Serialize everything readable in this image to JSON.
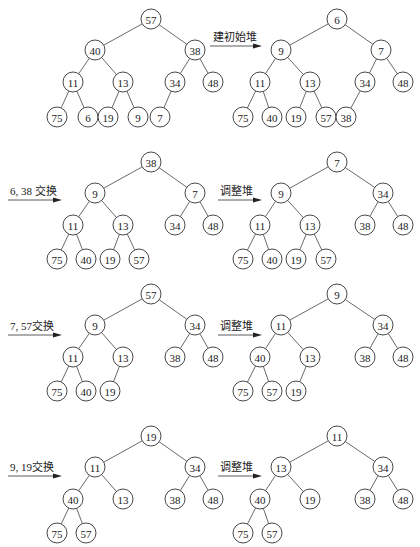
{
  "figure": {
    "node_radius": 10
  },
  "panels": [
    {
      "id": "initial-tree",
      "caption": "",
      "nodes": [
        {
          "v": "57",
          "x": 151,
          "y": 19
        },
        {
          "v": "40",
          "x": 95,
          "y": 50
        },
        {
          "v": "38",
          "x": 195,
          "y": 50
        },
        {
          "v": "11",
          "x": 73,
          "y": 82
        },
        {
          "v": "13",
          "x": 123,
          "y": 82
        },
        {
          "v": "34",
          "x": 175,
          "y": 82
        },
        {
          "v": "48",
          "x": 213,
          "y": 82
        },
        {
          "v": "75",
          "x": 57,
          "y": 117
        },
        {
          "v": "6",
          "x": 88,
          "y": 117
        },
        {
          "v": "19",
          "x": 108,
          "y": 117
        },
        {
          "v": "9",
          "x": 138,
          "y": 117
        },
        {
          "v": "7",
          "x": 160,
          "y": 117
        }
      ],
      "edges": [
        [
          0,
          1
        ],
        [
          0,
          2
        ],
        [
          1,
          3
        ],
        [
          1,
          4
        ],
        [
          2,
          5
        ],
        [
          2,
          6
        ],
        [
          3,
          7
        ],
        [
          3,
          8
        ],
        [
          4,
          9
        ],
        [
          4,
          10
        ],
        [
          5,
          11
        ]
      ]
    },
    {
      "id": "build-heap",
      "caption": "建初始堆",
      "arrow": {
        "x1": 210,
        "y1": 46,
        "x2": 262,
        "y2": 46,
        "lx": 213,
        "ly": 41
      },
      "nodes": [
        {
          "v": "6",
          "x": 337,
          "y": 19
        },
        {
          "v": "9",
          "x": 281,
          "y": 50
        },
        {
          "v": "7",
          "x": 381,
          "y": 50
        },
        {
          "v": "11",
          "x": 260,
          "y": 82
        },
        {
          "v": "13",
          "x": 310,
          "y": 82
        },
        {
          "v": "34",
          "x": 365,
          "y": 82
        },
        {
          "v": "48",
          "x": 403,
          "y": 82
        },
        {
          "v": "75",
          "x": 243,
          "y": 117
        },
        {
          "v": "40",
          "x": 272,
          "y": 117
        },
        {
          "v": "19",
          "x": 296,
          "y": 117
        },
        {
          "v": "57",
          "x": 326,
          "y": 117
        },
        {
          "v": "38",
          "x": 346,
          "y": 117
        }
      ],
      "edges": [
        [
          0,
          1
        ],
        [
          0,
          2
        ],
        [
          1,
          3
        ],
        [
          1,
          4
        ],
        [
          2,
          5
        ],
        [
          2,
          6
        ],
        [
          3,
          7
        ],
        [
          3,
          8
        ],
        [
          4,
          9
        ],
        [
          4,
          10
        ],
        [
          5,
          11
        ]
      ]
    },
    {
      "id": "swap-6-38",
      "caption": "6, 38 交换",
      "arrow": {
        "x1": 8,
        "y1": 200,
        "x2": 62,
        "y2": 200,
        "lx": 10,
        "ly": 195
      },
      "nodes": [
        {
          "v": "38",
          "x": 151,
          "y": 162
        },
        {
          "v": "9",
          "x": 95,
          "y": 193
        },
        {
          "v": "7",
          "x": 195,
          "y": 193
        },
        {
          "v": "11",
          "x": 73,
          "y": 225
        },
        {
          "v": "13",
          "x": 123,
          "y": 225
        },
        {
          "v": "34",
          "x": 175,
          "y": 225
        },
        {
          "v": "48",
          "x": 213,
          "y": 225
        },
        {
          "v": "75",
          "x": 57,
          "y": 259
        },
        {
          "v": "40",
          "x": 86,
          "y": 259
        },
        {
          "v": "19",
          "x": 110,
          "y": 259
        },
        {
          "v": "57",
          "x": 139,
          "y": 259
        }
      ],
      "edges": [
        [
          0,
          1
        ],
        [
          0,
          2
        ],
        [
          1,
          3
        ],
        [
          1,
          4
        ],
        [
          2,
          5
        ],
        [
          2,
          6
        ],
        [
          3,
          7
        ],
        [
          3,
          8
        ],
        [
          4,
          9
        ],
        [
          4,
          10
        ]
      ]
    },
    {
      "id": "adjust-1",
      "caption": "调整堆",
      "arrow": {
        "x1": 218,
        "y1": 200,
        "x2": 262,
        "y2": 200,
        "lx": 220,
        "ly": 195
      },
      "nodes": [
        {
          "v": "7",
          "x": 337,
          "y": 162
        },
        {
          "v": "9",
          "x": 281,
          "y": 193
        },
        {
          "v": "34",
          "x": 383,
          "y": 193
        },
        {
          "v": "11",
          "x": 260,
          "y": 225
        },
        {
          "v": "13",
          "x": 310,
          "y": 225
        },
        {
          "v": "38",
          "x": 365,
          "y": 225
        },
        {
          "v": "48",
          "x": 403,
          "y": 225
        },
        {
          "v": "75",
          "x": 243,
          "y": 259
        },
        {
          "v": "40",
          "x": 272,
          "y": 259
        },
        {
          "v": "19",
          "x": 296,
          "y": 259
        },
        {
          "v": "57",
          "x": 326,
          "y": 259
        }
      ],
      "edges": [
        [
          0,
          1
        ],
        [
          0,
          2
        ],
        [
          1,
          3
        ],
        [
          1,
          4
        ],
        [
          2,
          5
        ],
        [
          2,
          6
        ],
        [
          3,
          7
        ],
        [
          3,
          8
        ],
        [
          4,
          9
        ],
        [
          4,
          10
        ]
      ]
    },
    {
      "id": "swap-7-57",
      "caption": "7, 57交换",
      "arrow": {
        "x1": 8,
        "y1": 335,
        "x2": 62,
        "y2": 335,
        "lx": 10,
        "ly": 330
      },
      "nodes": [
        {
          "v": "57",
          "x": 151,
          "y": 294
        },
        {
          "v": "9",
          "x": 95,
          "y": 325
        },
        {
          "v": "34",
          "x": 195,
          "y": 325
        },
        {
          "v": "11",
          "x": 73,
          "y": 357
        },
        {
          "v": "13",
          "x": 123,
          "y": 357
        },
        {
          "v": "38",
          "x": 175,
          "y": 357
        },
        {
          "v": "48",
          "x": 213,
          "y": 357
        },
        {
          "v": "75",
          "x": 57,
          "y": 391
        },
        {
          "v": "40",
          "x": 86,
          "y": 391
        },
        {
          "v": "19",
          "x": 110,
          "y": 391
        }
      ],
      "edges": [
        [
          0,
          1
        ],
        [
          0,
          2
        ],
        [
          1,
          3
        ],
        [
          1,
          4
        ],
        [
          2,
          5
        ],
        [
          2,
          6
        ],
        [
          3,
          7
        ],
        [
          3,
          8
        ],
        [
          4,
          9
        ]
      ]
    },
    {
      "id": "adjust-2",
      "caption": "调整堆",
      "arrow": {
        "x1": 218,
        "y1": 335,
        "x2": 262,
        "y2": 335,
        "lx": 220,
        "ly": 330
      },
      "nodes": [
        {
          "v": "9",
          "x": 337,
          "y": 294
        },
        {
          "v": "11",
          "x": 281,
          "y": 325
        },
        {
          "v": "34",
          "x": 383,
          "y": 325
        },
        {
          "v": "40",
          "x": 260,
          "y": 357
        },
        {
          "v": "13",
          "x": 310,
          "y": 357
        },
        {
          "v": "38",
          "x": 365,
          "y": 357
        },
        {
          "v": "48",
          "x": 403,
          "y": 357
        },
        {
          "v": "75",
          "x": 243,
          "y": 391
        },
        {
          "v": "57",
          "x": 272,
          "y": 391
        },
        {
          "v": "19",
          "x": 296,
          "y": 391
        }
      ],
      "edges": [
        [
          0,
          1
        ],
        [
          0,
          2
        ],
        [
          1,
          3
        ],
        [
          1,
          4
        ],
        [
          2,
          5
        ],
        [
          2,
          6
        ],
        [
          3,
          7
        ],
        [
          3,
          8
        ],
        [
          4,
          9
        ]
      ]
    },
    {
      "id": "swap-9-19",
      "caption": "9, 19交换",
      "arrow": {
        "x1": 8,
        "y1": 476,
        "x2": 62,
        "y2": 476,
        "lx": 10,
        "ly": 471
      },
      "nodes": [
        {
          "v": "19",
          "x": 151,
          "y": 436
        },
        {
          "v": "11",
          "x": 95,
          "y": 467
        },
        {
          "v": "34",
          "x": 195,
          "y": 467
        },
        {
          "v": "40",
          "x": 73,
          "y": 499
        },
        {
          "v": "13",
          "x": 123,
          "y": 499
        },
        {
          "v": "38",
          "x": 175,
          "y": 499
        },
        {
          "v": "48",
          "x": 213,
          "y": 499
        },
        {
          "v": "75",
          "x": 57,
          "y": 533
        },
        {
          "v": "57",
          "x": 86,
          "y": 533
        }
      ],
      "edges": [
        [
          0,
          1
        ],
        [
          0,
          2
        ],
        [
          1,
          3
        ],
        [
          1,
          4
        ],
        [
          2,
          5
        ],
        [
          2,
          6
        ],
        [
          3,
          7
        ],
        [
          3,
          8
        ]
      ]
    },
    {
      "id": "adjust-3",
      "caption": "调整堆",
      "arrow": {
        "x1": 218,
        "y1": 476,
        "x2": 262,
        "y2": 476,
        "lx": 220,
        "ly": 471
      },
      "nodes": [
        {
          "v": "11",
          "x": 337,
          "y": 436
        },
        {
          "v": "13",
          "x": 281,
          "y": 467
        },
        {
          "v": "34",
          "x": 383,
          "y": 467
        },
        {
          "v": "40",
          "x": 260,
          "y": 499
        },
        {
          "v": "19",
          "x": 310,
          "y": 499
        },
        {
          "v": "38",
          "x": 365,
          "y": 499
        },
        {
          "v": "48",
          "x": 403,
          "y": 499
        },
        {
          "v": "75",
          "x": 243,
          "y": 533
        },
        {
          "v": "57",
          "x": 272,
          "y": 533
        }
      ],
      "edges": [
        [
          0,
          1
        ],
        [
          0,
          2
        ],
        [
          1,
          3
        ],
        [
          1,
          4
        ],
        [
          2,
          5
        ],
        [
          2,
          6
        ],
        [
          3,
          7
        ],
        [
          3,
          8
        ]
      ]
    }
  ]
}
